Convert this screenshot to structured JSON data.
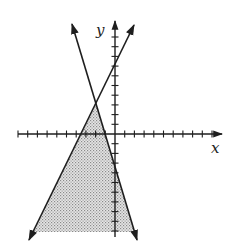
{
  "figure": {
    "type": "graph-of-linear-inequalities",
    "axes": {
      "x_label": "x",
      "y_label": "y",
      "origin_px": [
        115,
        134
      ],
      "tick_spacing_px": 9.7,
      "x_ticks_left": 10,
      "x_ticks_right": 10,
      "y_ticks_up": 10,
      "y_ticks_down": 10
    },
    "lines": [
      {
        "name": "line-negative-slope",
        "from_px": [
          72,
          24
        ],
        "to_px": [
          137,
          240
        ]
      },
      {
        "name": "line-positive-slope",
        "from_px": [
          134,
          25
        ],
        "to_px": [
          29,
          240
        ]
      }
    ],
    "shaded_region": {
      "description": "region below both lines, between them",
      "polygon_px": [
        [
          96,
          104
        ],
        [
          134,
          232
        ],
        [
          33,
          232
        ]
      ],
      "pattern": "dotted"
    },
    "colors": {
      "line": "#1e1e1e",
      "shade": "#b8b8b8",
      "background": "#ffffff"
    }
  }
}
